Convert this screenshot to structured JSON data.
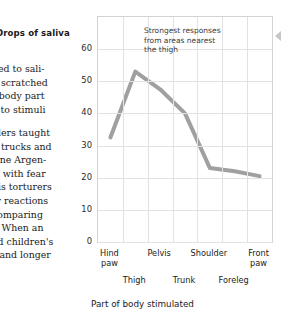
{
  "page": {
    "body_text": {
      "paragraph_1": [
        "ued  to  sali-",
        "n  scratched",
        "t body part",
        "e to stimuli"
      ],
      "paragraph_2": [
        "dlers taught",
        "g trucks and",
        "One Argen-",
        "ls  with  fear",
        "nis torturers",
        "ty  reactions",
        "comparing",
        "). When  an",
        "ed children's",
        "r and longer"
      ]
    }
  },
  "chart_data": {
    "type": "line",
    "title": "",
    "ylabel": "Drops of saliva",
    "xlabel": "Part of body stimulated",
    "categories": [
      "Hind paw",
      "Thigh",
      "Pelvis",
      "Trunk",
      "Shoulder",
      "Foreleg",
      "Front paw"
    ],
    "values": [
      32.5,
      53,
      47.5,
      40,
      23,
      22,
      20.5
    ],
    "ylim": [
      0,
      70
    ],
    "yticks": [
      0,
      10,
      20,
      30,
      40,
      50,
      60
    ],
    "ytick_labels": [
      "0",
      "10",
      "20",
      "30",
      "40",
      "50",
      "60"
    ],
    "grid": true,
    "legend": "none",
    "series_color": "#a0a0a0",
    "grid_color": "#e2e2e2",
    "annotations": [
      {
        "lines": [
          "Strongest responses",
          "from areas nearest",
          "the thigh"
        ],
        "text": "Strongest responses from areas nearest the thigh"
      }
    ]
  }
}
